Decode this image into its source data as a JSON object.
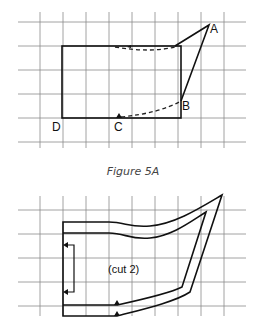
{
  "figure_top": {
    "labels": {
      "A": "A",
      "B": "B",
      "C": "C",
      "D": "D"
    },
    "caption": "Figure 5A"
  },
  "figure_bottom": {
    "note": "(cut 2)"
  }
}
